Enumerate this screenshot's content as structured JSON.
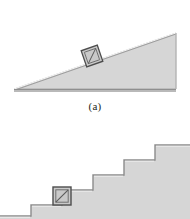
{
  "figure": {
    "caption_a": "(a)",
    "palette": {
      "background": "#ffffff",
      "surface_fill": "#d6d6d6",
      "surface_stroke": "#8c8c8c",
      "surface_edge_light": "#efefef",
      "crate_fill": "#c9c9c9",
      "crate_stroke": "#4d4d4d",
      "crate_inner_stroke": "#6b6b6b",
      "crate_brace": "#5a5a5a",
      "caption_color": "#231f20"
    },
    "panels": [
      {
        "id": "incline",
        "name": "inclined-plane-panel",
        "label": "(a)",
        "shape": "right-triangle-ramp",
        "ramp": {
          "apex_x": 176,
          "apex_y": 33,
          "left_tip_x": 14,
          "left_tip_y": 89,
          "base_right_x": 176,
          "base_y": 89,
          "base_thickness": 3
        },
        "crate": {
          "name": "crate-on-incline",
          "center_x": 92,
          "center_y": 56,
          "size": 17,
          "rotation_deg": -19
        }
      },
      {
        "id": "stairs",
        "name": "staircase-panel",
        "label": "",
        "shape": "staircase",
        "staircase": {
          "step_count": 5,
          "tread_width": 31,
          "riser_height": 15,
          "start_x": 31,
          "base_y": 102,
          "right_x": 190
        },
        "crate": {
          "name": "crate-on-stair",
          "center_x": 62,
          "center_y": 79,
          "size": 18,
          "rotation_deg": 0
        }
      }
    ]
  }
}
